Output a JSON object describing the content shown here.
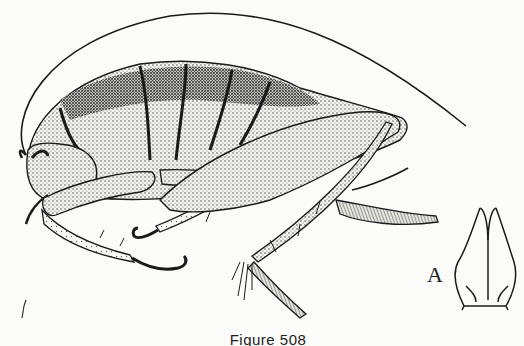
{
  "figure": {
    "caption": "Figure 508",
    "inset_label": "A",
    "colors": {
      "ink": "#1a1a1a",
      "paper": "#fbfbf9",
      "stipple_mid": "#8a8a8a",
      "stipple_dark": "#3a3a3a"
    }
  }
}
